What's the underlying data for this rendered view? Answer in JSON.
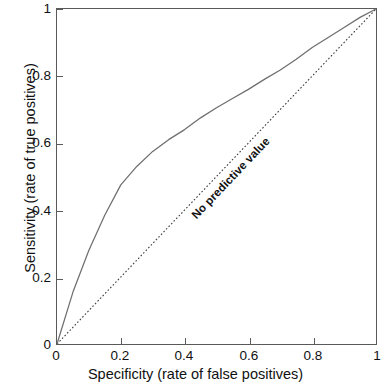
{
  "chart_data": {
    "type": "line",
    "title": "",
    "xlabel": "Specificity (rate of false positives)",
    "ylabel": "Sensitivity (rate of true positives)",
    "xlim": [
      0,
      1
    ],
    "ylim": [
      0,
      1
    ],
    "grid": false,
    "legend": "none",
    "xticks": [
      "0",
      "0.2",
      "0.4",
      "0.6",
      "0.8",
      "1"
    ],
    "xtick_values": [
      0,
      0.2,
      0.4,
      0.6,
      0.8,
      1
    ],
    "yticks": [
      "0",
      "0.2",
      "0.4",
      "0.6",
      "0.8",
      "1"
    ],
    "ytick_values": [
      0,
      0.2,
      0.4,
      0.6,
      0.8,
      1
    ],
    "annotations": [
      {
        "text": "No predictive value",
        "x": 0.45,
        "y": 0.45,
        "rotation": -46.5,
        "bold": true
      }
    ],
    "series": [
      {
        "name": "ROC curve",
        "style": "solid",
        "color": "#6e6e6e",
        "x": [
          0,
          0.05,
          0.1,
          0.15,
          0.2,
          0.25,
          0.3,
          0.35,
          0.4,
          0.45,
          0.5,
          0.55,
          0.6,
          0.65,
          0.7,
          0.75,
          0.8,
          0.85,
          0.9,
          0.95,
          1
        ],
        "values": [
          0,
          0.155,
          0.28,
          0.385,
          0.475,
          0.53,
          0.575,
          0.61,
          0.64,
          0.675,
          0.705,
          0.733,
          0.76,
          0.79,
          0.818,
          0.85,
          0.885,
          0.915,
          0.945,
          0.975,
          1
        ]
      },
      {
        "name": "No predictive value",
        "style": "dotted",
        "color": "#3a3a3a",
        "x": [
          0,
          1
        ],
        "values": [
          0,
          1
        ]
      }
    ]
  },
  "axes": {
    "x_title": "Specificity (rate of false positives)",
    "y_title": "Sensitivity (rate of true positives)",
    "x_tick_labels": [
      "0",
      "0.2",
      "0.4",
      "0.6",
      "0.8",
      "1"
    ],
    "y_tick_labels": [
      "0",
      "0.2",
      "0.4",
      "0.6",
      "0.8",
      "1"
    ]
  },
  "annotation": {
    "no_predictive_value": "No predictive value"
  },
  "colors": {
    "roc_curve": "#6e6e6e",
    "diagonal": "#3a3a3a",
    "frame": "#5a5a5a",
    "text": "#111111",
    "background": "#ffffff"
  }
}
